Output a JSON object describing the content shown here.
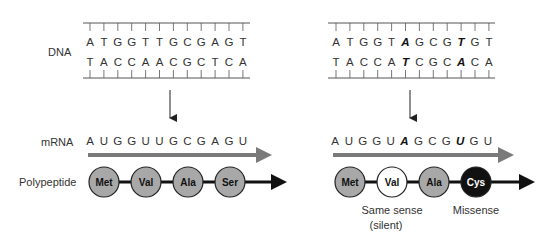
{
  "labels": {
    "dna": "DNA",
    "mrna": "mRNA",
    "polypeptide": "Polypeptide"
  },
  "colors": {
    "line": "#555555",
    "mrna_arrow": "#7a7a7a",
    "aa_normal": "#a8a8a8",
    "aa_silent": "#ffffff",
    "aa_missense": "#111111",
    "highlight_base": "#c0392b"
  },
  "panels": [
    {
      "id": "wild-type",
      "dna_top": [
        "A",
        "T",
        "G",
        "G",
        "T",
        "T",
        "G",
        "C",
        "G",
        "A",
        "G",
        "T"
      ],
      "dna_bottom": [
        "T",
        "A",
        "C",
        "C",
        "A",
        "A",
        "C",
        "G",
        "C",
        "T",
        "C",
        "A"
      ],
      "mrna": [
        "A",
        "U",
        "G",
        "G",
        "U",
        "U",
        "G",
        "C",
        "G",
        "A",
        "G",
        "U"
      ],
      "mutated_positions": [],
      "amino_acids": [
        {
          "name": "Met",
          "style": "normal"
        },
        {
          "name": "Val",
          "style": "normal"
        },
        {
          "name": "Ala",
          "style": "normal"
        },
        {
          "name": "Ser",
          "style": "normal"
        }
      ],
      "notes": []
    },
    {
      "id": "mutant",
      "dna_top": [
        "A",
        "T",
        "G",
        "G",
        "T",
        "A",
        "G",
        "C",
        "G",
        "T",
        "G",
        "T"
      ],
      "dna_bottom": [
        "T",
        "A",
        "C",
        "C",
        "A",
        "T",
        "C",
        "G",
        "C",
        "A",
        "C",
        "A"
      ],
      "mrna": [
        "A",
        "U",
        "G",
        "G",
        "U",
        "A",
        "G",
        "C",
        "G",
        "U",
        "G",
        "U"
      ],
      "mutated_positions": [
        5,
        9
      ],
      "amino_acids": [
        {
          "name": "Met",
          "style": "normal"
        },
        {
          "name": "Val",
          "style": "silent"
        },
        {
          "name": "Ala",
          "style": "normal"
        },
        {
          "name": "Cys",
          "style": "missense"
        }
      ],
      "notes": [
        {
          "lines": [
            "Same sense",
            "(silent)"
          ],
          "under_index": 1
        },
        {
          "lines": [
            "Missense"
          ],
          "under_index": 3
        }
      ]
    }
  ]
}
